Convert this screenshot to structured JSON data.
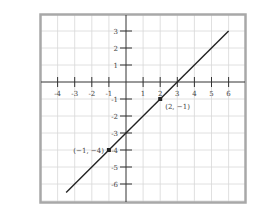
{
  "chart_data": {
    "type": "line",
    "title": "",
    "xlabel": "",
    "ylabel": "",
    "xlim": [
      -5,
      7
    ],
    "ylim": [
      -7,
      4
    ],
    "grid": true,
    "x_ticks": [
      -4,
      -3,
      -2,
      -1,
      1,
      2,
      3,
      4,
      5,
      6
    ],
    "y_ticks": [
      3,
      2,
      1,
      -1,
      -2,
      -3,
      -4,
      -5,
      -6
    ],
    "x_tick_labels": [
      "-4",
      "-3",
      "-2",
      "-1",
      "1",
      "2",
      "3",
      "4",
      "5",
      "6"
    ],
    "y_tick_labels": [
      "3",
      "2",
      "1",
      "-1",
      "-2",
      "-3",
      "-4",
      "-5",
      "-6"
    ],
    "series": [
      {
        "name": "line",
        "x": [
          -3.5,
          6
        ],
        "y": [
          -6.5,
          3
        ]
      }
    ],
    "points": [
      {
        "x": 2,
        "y": -1,
        "label": "(2, −1)"
      },
      {
        "x": -1,
        "y": -4,
        "label": "(−1, −4)"
      }
    ],
    "colors": {
      "line": "#222222",
      "grid": "#d8d8d8",
      "frame": "#a8a8a8",
      "axis": "#333333"
    }
  }
}
